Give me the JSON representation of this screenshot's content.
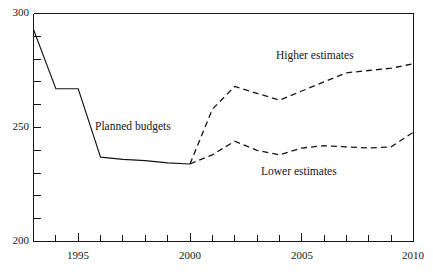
{
  "chart_data": {
    "type": "line",
    "title": "",
    "subtitle": "",
    "xlabel": "",
    "ylabel": "",
    "xlim": [
      1993,
      2010
    ],
    "ylim": [
      200,
      300
    ],
    "grid": false,
    "legend_position": "inline-annotations",
    "y_ticks_major": [
      200,
      250,
      300
    ],
    "y_tick_labels": [
      "200",
      "250",
      "300"
    ],
    "y_ticks_minor": [
      210,
      220,
      230,
      240,
      260,
      270,
      280,
      290
    ],
    "x_ticks": [
      1993,
      1994,
      1995,
      1996,
      1997,
      1998,
      1999,
      2000,
      2001,
      2002,
      2003,
      2004,
      2005,
      2006,
      2007,
      2008,
      2009,
      2010
    ],
    "x_tick_labels": [
      {
        "value": 1995,
        "label": "1995"
      },
      {
        "value": 2000,
        "label": "2000"
      },
      {
        "value": 2005,
        "label": "2005"
      },
      {
        "value": 2010,
        "label": "2010"
      }
    ],
    "series": [
      {
        "name": "Planned budgets",
        "style": "solid",
        "label": "Planned budgets",
        "x": [
          1993,
          1994,
          1995,
          1996,
          1997,
          1998,
          1999,
          2000
        ],
        "values": [
          293,
          267,
          267,
          237,
          236,
          235.5,
          234.5,
          234
        ]
      },
      {
        "name": "Higher estimates",
        "style": "dashed",
        "label": "Higher estimates",
        "x": [
          2000,
          2001,
          2002,
          2003,
          2004,
          2005,
          2006,
          2007,
          2008,
          2009,
          2010
        ],
        "values": [
          234,
          258,
          268,
          265,
          262,
          266,
          270,
          274,
          275,
          276,
          278
        ]
      },
      {
        "name": "Lower estimates",
        "style": "dashed",
        "label": "Lower estimates",
        "x": [
          2000,
          2001,
          2002,
          2003,
          2004,
          2005,
          2006,
          2007,
          2008,
          2009,
          2010
        ],
        "values": [
          234,
          238,
          244,
          240,
          238,
          241,
          242,
          241.5,
          241,
          241.5,
          248
        ]
      }
    ],
    "annotations": [
      {
        "text": "Planned budgets",
        "x_px": 95,
        "y_px": 121
      },
      {
        "text": "Higher estimates",
        "x_px": 276,
        "y_px": 50
      },
      {
        "text": "Lower estimates",
        "x_px": 261,
        "y_px": 166
      }
    ]
  },
  "axes": {
    "y_label_300": "300",
    "y_label_250": "250",
    "y_label_200": "200",
    "x_label_1995": "1995",
    "x_label_2000": "2000",
    "x_label_2005": "2005",
    "x_label_2010": "2010"
  },
  "colors": {
    "ink": "#151515",
    "background": "#ffffff"
  }
}
